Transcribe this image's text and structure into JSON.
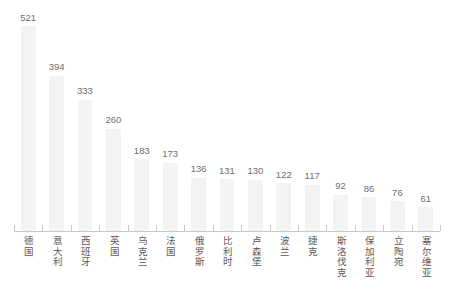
{
  "chart_data": {
    "type": "bar",
    "title": "",
    "subtitle": "",
    "xlabel": "",
    "ylabel": "",
    "grid": false,
    "legend": null,
    "ylim": [
      0,
      521
    ],
    "categories": [
      "德国",
      "意大利",
      "西班牙",
      "英国",
      "乌克兰",
      "法国",
      "俄罗斯",
      "比利时",
      "卢森堡",
      "波兰",
      "捷克",
      "斯洛伐克",
      "保加利亚",
      "立陶宛",
      "塞尔维亚"
    ],
    "values": [
      521,
      394,
      333,
      260,
      183,
      173,
      136,
      131,
      130,
      122,
      117,
      92,
      86,
      76,
      61
    ],
    "value_labels": [
      "521",
      "394",
      "333",
      "260",
      "183",
      "173",
      "136",
      "131",
      "130",
      "122",
      "117",
      "92",
      "86",
      "76",
      "61"
    ]
  },
  "style": {
    "bar_color": "#f3f3f3",
    "value_label_color": "#6e6e6e",
    "category_label_color": "#5a5a5a",
    "axis_color": "#c9c9c9",
    "background": "#ffffff"
  }
}
